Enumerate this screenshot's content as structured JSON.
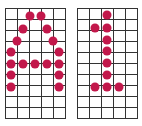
{
  "colors": {
    "dot": "#c2184b",
    "grid_line": "#333333",
    "background": "#ffffff"
  },
  "grids": [
    {
      "name": "left-grid",
      "letter": "A",
      "left": 5,
      "top": 8,
      "cols": 5,
      "rows": 10,
      "dots": [
        [
          30,
          16
        ],
        [
          41,
          16
        ],
        [
          23,
          29
        ],
        [
          47,
          29
        ],
        [
          17,
          41
        ],
        [
          53,
          41
        ],
        [
          11,
          52
        ],
        [
          59,
          52
        ],
        [
          11,
          64
        ],
        [
          23,
          64
        ],
        [
          35,
          64
        ],
        [
          47,
          64
        ],
        [
          59,
          64
        ],
        [
          11,
          75
        ],
        [
          59,
          75
        ],
        [
          11,
          87
        ],
        [
          59,
          87
        ]
      ]
    },
    {
      "name": "right-grid",
      "letter": "1",
      "left": 77,
      "top": 8,
      "cols": 5,
      "rows": 10,
      "dots": [
        [
          107,
          15
        ],
        [
          95,
          28
        ],
        [
          107,
          28
        ],
        [
          107,
          40
        ],
        [
          107,
          51
        ],
        [
          107,
          63
        ],
        [
          107,
          75
        ],
        [
          95,
          87
        ],
        [
          107,
          87
        ],
        [
          119,
          87
        ]
      ]
    }
  ]
}
